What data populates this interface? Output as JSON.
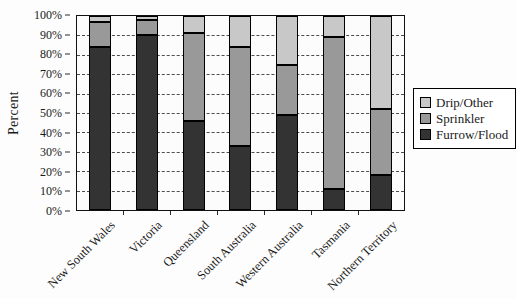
{
  "figure": {
    "y_axis_title": "Percent",
    "y_tick_labels_top_down": [
      "100%",
      "90%",
      "80%",
      "70%",
      "60%",
      "50%",
      "40%",
      "30%",
      "20%",
      "10%",
      "0%"
    ]
  },
  "legend": {
    "items": [
      {
        "label": "Drip/Other",
        "color": "#c8c8c8"
      },
      {
        "label": "Sprinkler",
        "color": "#999999"
      },
      {
        "label": "Furrow/Flood",
        "color": "#333333"
      }
    ]
  },
  "chart_data": {
    "type": "bar",
    "subtype": "stacked-percent",
    "title": "",
    "xlabel": "",
    "ylabel": "Percent",
    "ylim": [
      0,
      100
    ],
    "y_tick_step": 10,
    "grid": "horizontal-dashed",
    "legend_position": "right",
    "categories": [
      "New South Wales",
      "Victoria",
      "Queensland",
      "South Australia",
      "Western Australia",
      "Tasmania",
      "Northern Territory"
    ],
    "series": [
      {
        "name": "Furrow/Flood",
        "color": "#333333",
        "values": [
          84,
          90,
          46,
          33,
          49,
          11,
          18
        ]
      },
      {
        "name": "Sprinkler",
        "color": "#999999",
        "values": [
          13,
          8,
          45,
          51,
          26,
          78,
          34
        ]
      },
      {
        "name": "Drip/Other",
        "color": "#c8c8c8",
        "values": [
          3,
          2,
          9,
          16,
          25,
          11,
          48
        ]
      }
    ]
  }
}
